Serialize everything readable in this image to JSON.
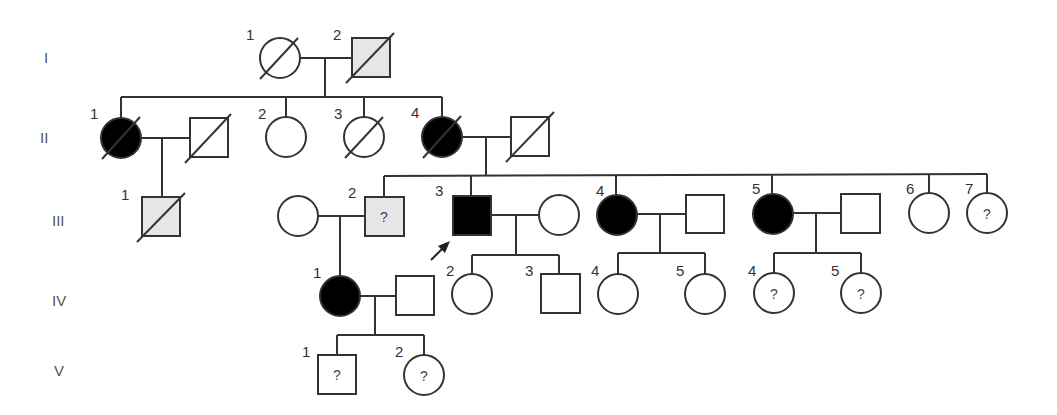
{
  "diagram": {
    "type": "pedigree",
    "colors": {
      "affected": "#000000",
      "carrier_or_uncertain": "#e6e6e6",
      "unaffected": "#ffffff",
      "line": "#333333"
    },
    "generations": [
      "I",
      "II",
      "III",
      "IV",
      "V"
    ],
    "legend_symbols": {
      "unknown_status": "?",
      "proband": "arrow"
    },
    "individuals": [
      {
        "id": "I-1",
        "label": "1",
        "sex": "female",
        "status": "unaffected",
        "deceased": true
      },
      {
        "id": "I-2",
        "label": "2",
        "sex": "male",
        "status": "gray",
        "deceased": true
      },
      {
        "id": "II-1",
        "label": "1",
        "sex": "female",
        "status": "affected",
        "deceased": true
      },
      {
        "id": "II-1-spouse",
        "label": "",
        "sex": "male",
        "status": "unaffected",
        "deceased": true
      },
      {
        "id": "II-2",
        "label": "2",
        "sex": "female",
        "status": "unaffected",
        "deceased": false
      },
      {
        "id": "II-3",
        "label": "3",
        "sex": "female",
        "status": "unaffected",
        "deceased": true
      },
      {
        "id": "II-4",
        "label": "4",
        "sex": "female",
        "status": "affected",
        "deceased": true
      },
      {
        "id": "II-4-spouse",
        "label": "",
        "sex": "male",
        "status": "unaffected",
        "deceased": true
      },
      {
        "id": "III-1",
        "label": "1",
        "sex": "male",
        "status": "gray",
        "deceased": true
      },
      {
        "id": "III-2-spouse",
        "label": "",
        "sex": "female",
        "status": "unaffected",
        "deceased": false
      },
      {
        "id": "III-2",
        "label": "2",
        "sex": "male",
        "status": "gray",
        "deceased": false,
        "mark": "?"
      },
      {
        "id": "III-3",
        "label": "3",
        "sex": "male",
        "status": "affected",
        "deceased": false,
        "proband": true
      },
      {
        "id": "III-3-spouse",
        "label": "",
        "sex": "female",
        "status": "unaffected",
        "deceased": false
      },
      {
        "id": "III-4",
        "label": "4",
        "sex": "female",
        "status": "affected",
        "deceased": false
      },
      {
        "id": "III-4-spouse",
        "label": "",
        "sex": "male",
        "status": "unaffected",
        "deceased": false
      },
      {
        "id": "III-5",
        "label": "5",
        "sex": "female",
        "status": "affected",
        "deceased": false
      },
      {
        "id": "III-5-spouse",
        "label": "",
        "sex": "male",
        "status": "unaffected",
        "deceased": false
      },
      {
        "id": "III-6",
        "label": "6",
        "sex": "female",
        "status": "unaffected",
        "deceased": false
      },
      {
        "id": "III-7",
        "label": "7",
        "sex": "female",
        "status": "unknown",
        "deceased": false,
        "mark": "?"
      },
      {
        "id": "IV-1",
        "label": "1",
        "sex": "female",
        "status": "affected",
        "deceased": false
      },
      {
        "id": "IV-1-spouse",
        "label": "",
        "sex": "male",
        "status": "unaffected",
        "deceased": false
      },
      {
        "id": "IV-2",
        "label": "2",
        "sex": "female",
        "status": "unaffected",
        "deceased": false
      },
      {
        "id": "IV-3",
        "label": "3",
        "sex": "male",
        "status": "unaffected",
        "deceased": false
      },
      {
        "id": "IV-4a",
        "label": "4",
        "sex": "female",
        "status": "unaffected",
        "deceased": false
      },
      {
        "id": "IV-5a",
        "label": "5",
        "sex": "female",
        "status": "unaffected",
        "deceased": false
      },
      {
        "id": "IV-4b",
        "label": "4",
        "sex": "female",
        "status": "unknown",
        "deceased": false,
        "mark": "?"
      },
      {
        "id": "IV-5b",
        "label": "5",
        "sex": "female",
        "status": "unknown",
        "deceased": false,
        "mark": "?"
      },
      {
        "id": "V-1",
        "label": "1",
        "sex": "male",
        "status": "unknown",
        "deceased": false,
        "mark": "?"
      },
      {
        "id": "V-2",
        "label": "2",
        "sex": "female",
        "status": "unknown",
        "deceased": false,
        "mark": "?"
      }
    ]
  },
  "labels": {
    "gen": {
      "g1": "I",
      "g2": "II",
      "g3": "III",
      "g4": "IV",
      "g5": "V"
    },
    "n1": "1",
    "n2": "2",
    "n3": "3",
    "n4": "4",
    "n5": "5",
    "n6": "6",
    "n7": "7",
    "q": "?"
  }
}
